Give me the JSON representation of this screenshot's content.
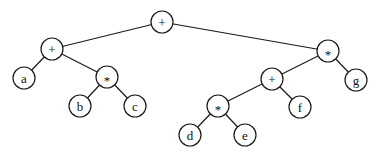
{
  "diagram": {
    "type": "expression-tree",
    "node_radius": 11,
    "colors": {
      "stroke": "#1a1a1a",
      "fill": "#ffffff",
      "text": "#111111"
    },
    "nodes": [
      {
        "id": "n0",
        "label": "+",
        "x": 162,
        "y": 22
      },
      {
        "id": "n1",
        "label": "+",
        "x": 52,
        "y": 49
      },
      {
        "id": "n2",
        "label": "a",
        "x": 24,
        "y": 78
      },
      {
        "id": "n3",
        "label": "*",
        "x": 107,
        "y": 77
      },
      {
        "id": "n4",
        "label": "b",
        "x": 80,
        "y": 106
      },
      {
        "id": "n5",
        "label": "c",
        "x": 135,
        "y": 106
      },
      {
        "id": "n6",
        "label": "*",
        "x": 328,
        "y": 51
      },
      {
        "id": "n7",
        "label": "g",
        "x": 356,
        "y": 80
      },
      {
        "id": "n8",
        "label": "+",
        "x": 272,
        "y": 79
      },
      {
        "id": "n9",
        "label": "f",
        "x": 300,
        "y": 107
      },
      {
        "id": "n10",
        "label": "*",
        "x": 218,
        "y": 106
      },
      {
        "id": "n11",
        "label": "d",
        "x": 190,
        "y": 135
      },
      {
        "id": "n12",
        "label": "e",
        "x": 245,
        "y": 135
      }
    ],
    "edges": [
      [
        "n0",
        "n1"
      ],
      [
        "n0",
        "n6"
      ],
      [
        "n1",
        "n2"
      ],
      [
        "n1",
        "n3"
      ],
      [
        "n3",
        "n4"
      ],
      [
        "n3",
        "n5"
      ],
      [
        "n6",
        "n8"
      ],
      [
        "n6",
        "n7"
      ],
      [
        "n8",
        "n10"
      ],
      [
        "n8",
        "n9"
      ],
      [
        "n10",
        "n11"
      ],
      [
        "n10",
        "n12"
      ]
    ]
  }
}
